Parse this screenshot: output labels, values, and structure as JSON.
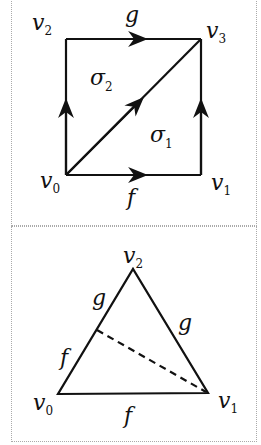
{
  "figure1": {
    "vertices": {
      "v0": "v",
      "v0_sub": "0",
      "v1": "v",
      "v1_sub": "1",
      "v2": "v",
      "v2_sub": "2",
      "v3": "v",
      "v3_sub": "3"
    },
    "edge_labels": {
      "top": "g",
      "bottom": "f"
    },
    "simplices": {
      "sigma1": "σ",
      "sigma1_sub": "1",
      "sigma2": "σ",
      "sigma2_sub": "2"
    }
  },
  "figure2": {
    "vertices": {
      "v0": "v",
      "v0_sub": "0",
      "v1": "v",
      "v1_sub": "1",
      "v2": "v",
      "v2_sub": "2"
    },
    "edge_labels": {
      "left_upper": "g",
      "left_lower": "f",
      "right": "g",
      "bottom": "f"
    }
  },
  "colors": {
    "stroke": "#111111",
    "border": "#aaaaaa"
  }
}
